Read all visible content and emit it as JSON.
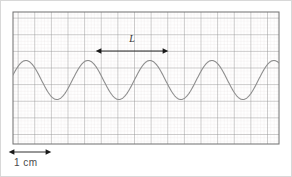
{
  "figure": {
    "title": "",
    "background_color": "#ffffff",
    "border_color": "#d8d8d8"
  },
  "grid": {
    "minor_color": "#ece6e6",
    "major_color": "#8e8e8e",
    "border_color": "#6e6e6e",
    "minor_spacing_px": 3.325,
    "major_spacing_px": 16.625,
    "left_px": 12,
    "top_px": 11,
    "width_px": 266,
    "height_px": 132
  },
  "annotations": {
    "wavelength_label": "L",
    "wavelength_label_color": "#333333",
    "scale_label": "1 cm",
    "scale_label_color": "#4a4a4a",
    "arrow_color": "#1a1a1a"
  },
  "chart_data": {
    "type": "line",
    "title": "",
    "xlabel": "",
    "ylabel": "",
    "grid": true,
    "legend": "none",
    "series": [
      {
        "name": "wave",
        "color": "#8d8d8d",
        "line_width": 1.1,
        "waveform": "sine",
        "cycles": 4.28,
        "wavelength_px": 62,
        "amplitude_px": 19.5,
        "centerline_y_px": 79,
        "phase_deg": 15,
        "x_start_px": 12,
        "x_end_px": 278
      }
    ],
    "annotations": [
      {
        "name": "wavelength-marker",
        "label": "L",
        "type": "double-arrow",
        "x1_px": 100,
        "x2_px": 162,
        "y_px": 50,
        "label_x_px": 131,
        "label_y_px": 41,
        "meaning": "one wavelength, measured peak to peak"
      },
      {
        "name": "scale-bar",
        "label": "1 cm",
        "type": "double-arrow",
        "x1_px": 13,
        "x2_px": 45,
        "y_px": 151,
        "meaning": "horizontal scale: 1 cm equals 2 major grid squares"
      }
    ],
    "axis_ranges": {
      "x_px": [
        12,
        278
      ],
      "y_px": [
        11,
        143
      ]
    }
  }
}
